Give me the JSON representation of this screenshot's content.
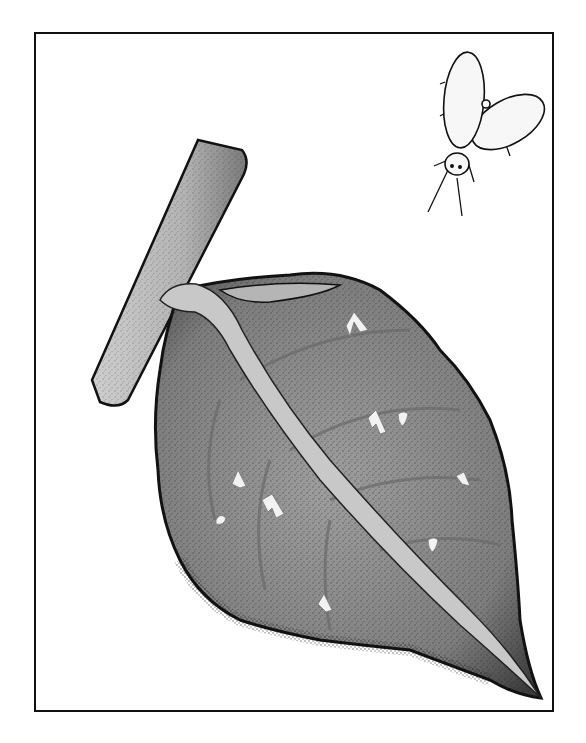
{
  "illustration": {
    "subject": "whitefly and infested leaf",
    "frame": {
      "border_color": "#111111",
      "background": "#ffffff"
    },
    "colors": {
      "outline": "#111111",
      "stem_fill": "#b9b9b9",
      "leaf_fill": "#8f8f8f",
      "leaf_shadow": "#5a5a5a",
      "midrib_fill": "#c4c4c4",
      "nymph_fill": "#f2f2f2",
      "fly_fill": "#f7f7f7"
    },
    "elements": [
      {
        "name": "whitefly",
        "icon": "whitefly-icon"
      },
      {
        "name": "stem",
        "icon": "stem-icon"
      },
      {
        "name": "leaf",
        "icon": "leaf-icon"
      },
      {
        "name": "nymphs",
        "count": 10,
        "icon": "nymph-icon"
      }
    ]
  }
}
